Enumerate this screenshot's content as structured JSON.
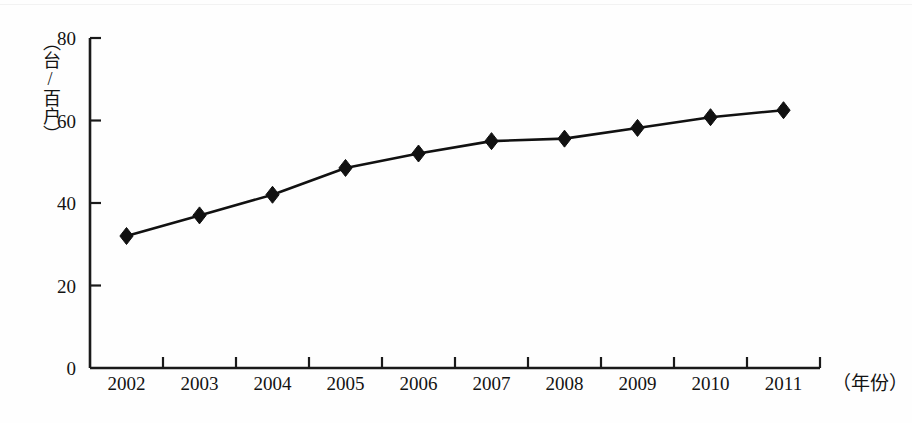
{
  "chart_data": {
    "type": "line",
    "title": "",
    "subtitle": "",
    "xlabel": "（年份）",
    "ylabel": "（台/百户）",
    "categories": [
      "2002",
      "2003",
      "2004",
      "2005",
      "2006",
      "2007",
      "2008",
      "2009",
      "2010",
      "2011"
    ],
    "values": [
      32,
      37,
      42,
      48.5,
      52,
      55,
      55.6,
      58.2,
      60.8,
      62.5
    ],
    "series": [
      {
        "name": "",
        "values": [
          32,
          37,
          42,
          48.5,
          52,
          55,
          55.6,
          58.2,
          60.8,
          62.5
        ]
      }
    ],
    "ylim": [
      0,
      80
    ],
    "y_ticks": [
      0,
      20,
      40,
      60,
      80
    ],
    "y_tick_labels": [
      "0",
      "20",
      "40",
      "60",
      "80"
    ],
    "grid": false,
    "legend": "none",
    "marker": "diamond",
    "line_color": "#111111",
    "marker_color": "#111111"
  },
  "axes": {
    "y_caption": "（台/百户）",
    "x_caption": "（年份）"
  }
}
